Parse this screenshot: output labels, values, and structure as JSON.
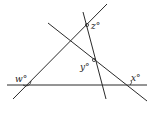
{
  "diagram": {
    "type": "geometry-intersecting-lines",
    "line_color": "#2a2a2a",
    "lines": [
      {
        "id": "horizontal",
        "x1": 7,
        "y1": 85,
        "x2": 147,
        "y2": 85
      },
      {
        "id": "rising",
        "x1": 13,
        "y1": 99,
        "x2": 107,
        "y2": 4
      },
      {
        "id": "falling",
        "x1": 48,
        "y1": 23,
        "x2": 147,
        "y2": 101
      },
      {
        "id": "steep",
        "x1": 83,
        "y1": 12,
        "x2": 106,
        "y2": 99
      }
    ],
    "labels": {
      "w": "w°",
      "z": "z°",
      "y": "y°",
      "x": "x°"
    }
  }
}
